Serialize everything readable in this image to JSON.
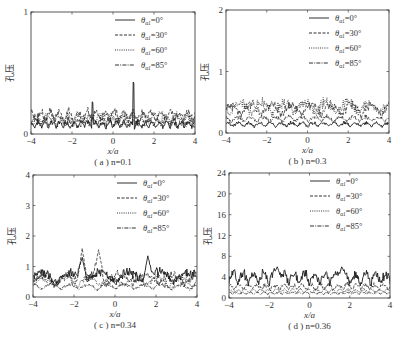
{
  "figure": {
    "background": "#ffffff",
    "line_color": "#1a1a1a"
  },
  "chart_data": [
    {
      "id": "a",
      "type": "line",
      "caption": "( a ) n=0.1",
      "caption_prefix": "( a )",
      "caption_n": "n=0.1",
      "xlabel": "x/a",
      "ylabel": "孔压",
      "xlim": [
        -4,
        4
      ],
      "ylim": [
        0,
        1
      ],
      "xticks": [
        -4,
        -2,
        0,
        2,
        4
      ],
      "yticks": [
        0,
        1
      ],
      "ytick_labels": [
        "0",
        "1"
      ],
      "grid": false,
      "legend_position": "upper right",
      "frame": {
        "x": 31,
        "y": 12,
        "w": 164,
        "h": 122
      },
      "series": [
        {
          "name": "θα1=0°",
          "style": "solid",
          "base": 0.05,
          "amp": 0.06,
          "freq": 9.0,
          "spikes": [
            [
              -1.0,
              0.38
            ],
            [
              1.0,
              0.65
            ]
          ]
        },
        {
          "name": "θα1=30°",
          "style": "dashed",
          "base": 0.1,
          "amp": 0.1,
          "freq": 7.0,
          "spikes": []
        },
        {
          "name": "θα1=60°",
          "style": "dotted",
          "base": 0.08,
          "amp": 0.09,
          "freq": 6.0,
          "spikes": []
        },
        {
          "name": "θα1=85°",
          "style": "dashdot",
          "base": 0.06,
          "amp": 0.08,
          "freq": 8.0,
          "spikes": []
        }
      ]
    },
    {
      "id": "b",
      "type": "line",
      "caption": "( b ) n=0.3",
      "caption_prefix": "( b )",
      "caption_n": "n=0.3",
      "xlabel": "x/a",
      "ylabel": "孔压",
      "xlim": [
        -4,
        4
      ],
      "ylim": [
        0,
        2
      ],
      "xticks": [
        -4,
        -2,
        0,
        2,
        4
      ],
      "yticks": [
        0,
        1,
        2
      ],
      "ytick_labels": [
        "0",
        "1",
        "2"
      ],
      "grid": false,
      "legend_position": "upper right",
      "frame": {
        "x": 226,
        "y": 10,
        "w": 163,
        "h": 123
      },
      "series": [
        {
          "name": "θα1=0°",
          "style": "solid",
          "base": 0.1,
          "amp": 0.08,
          "freq": 6.0,
          "spikes": []
        },
        {
          "name": "θα1=30°",
          "style": "dashed",
          "base": 0.28,
          "amp": 0.22,
          "freq": 3.2,
          "spikes": []
        },
        {
          "name": "θα1=60°",
          "style": "dotted",
          "base": 0.3,
          "amp": 0.25,
          "freq": 3.0,
          "spikes": []
        },
        {
          "name": "θα1=85°",
          "style": "dashdot",
          "base": 0.18,
          "amp": 0.1,
          "freq": 5.0,
          "spikes": []
        }
      ]
    },
    {
      "id": "c",
      "type": "line",
      "caption": "( c ) n=0.34",
      "caption_prefix": "( c )",
      "caption_n": "n=0.34",
      "xlabel": "x/a",
      "ylabel": "孔压",
      "xlim": [
        -4,
        4
      ],
      "ylim": [
        0,
        4
      ],
      "xticks": [
        -4,
        -2,
        0,
        2,
        4
      ],
      "yticks": [
        0,
        1,
        2,
        3,
        4
      ],
      "ytick_labels": [
        "0",
        "1",
        "2",
        "3",
        "4"
      ],
      "grid": false,
      "legend_position": "upper right",
      "frame": {
        "x": 33,
        "y": 175,
        "w": 164,
        "h": 122
      },
      "series": [
        {
          "name": "θα1=0°",
          "style": "solid",
          "base": 0.45,
          "amp": 0.45,
          "freq": 2.2,
          "spikes": [
            [
              -1.6,
              1.3
            ],
            [
              1.6,
              1.35
            ]
          ]
        },
        {
          "name": "θα1=30°",
          "style": "dashed",
          "base": 0.4,
          "amp": 0.4,
          "freq": 2.5,
          "spikes": [
            [
              -1.6,
              1.6
            ],
            [
              -0.8,
              1.55
            ]
          ]
        },
        {
          "name": "θα1=60°",
          "style": "dotted",
          "base": 0.35,
          "amp": 0.35,
          "freq": 2.8,
          "spikes": []
        },
        {
          "name": "θα1=85°",
          "style": "dashdot",
          "base": 0.25,
          "amp": 0.2,
          "freq": 3.5,
          "spikes": []
        }
      ]
    },
    {
      "id": "d",
      "type": "line",
      "caption": "( d ) n=0.36",
      "caption_prefix": "( d )",
      "caption_n": "n=0.36",
      "xlabel": "x/a",
      "ylabel": "孔压",
      "xlim": [
        -4,
        4
      ],
      "ylim": [
        0,
        24
      ],
      "xticks": [
        -4,
        -2,
        0,
        2,
        4
      ],
      "yticks": [
        0,
        4,
        8,
        12,
        16,
        20,
        24
      ],
      "ytick_labels": [
        "0",
        "4",
        "8",
        "12",
        "16",
        "20",
        "24"
      ],
      "grid": false,
      "legend_position": "upper right",
      "frame": {
        "x": 229,
        "y": 173,
        "w": 161,
        "h": 125
      },
      "series": [
        {
          "name": "θα1=0°",
          "style": "solid",
          "base": 2.6,
          "amp": 2.6,
          "freq": 6.2,
          "spikes": [
            [
              -1.6,
              6.0
            ],
            [
              1.6,
              6.0
            ]
          ]
        },
        {
          "name": "θα1=30°",
          "style": "dashed",
          "base": 1.6,
          "amp": 1.2,
          "freq": 7.0,
          "spikes": []
        },
        {
          "name": "θα1=60°",
          "style": "dotted",
          "base": 1.0,
          "amp": 0.8,
          "freq": 8.0,
          "spikes": []
        },
        {
          "name": "θα1=85°",
          "style": "dashdot",
          "base": 0.7,
          "amp": 0.5,
          "freq": 9.0,
          "spikes": []
        }
      ]
    }
  ],
  "legend": {
    "entries": [
      {
        "symbol": "θ",
        "sub": "α1",
        "value": "=0°",
        "style": "solid"
      },
      {
        "symbol": "θ",
        "sub": "α1",
        "value": "=30°",
        "style": "dashed"
      },
      {
        "symbol": "θ",
        "sub": "α1",
        "value": "=60°",
        "style": "dotted"
      },
      {
        "symbol": "θ",
        "sub": "α1",
        "value": "=85°",
        "style": "dashdot"
      }
    ]
  }
}
